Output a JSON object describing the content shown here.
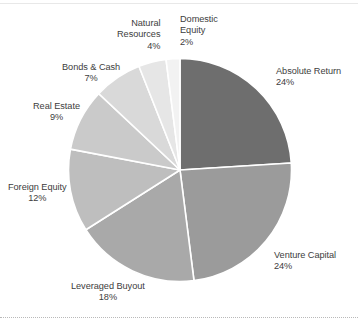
{
  "chart_data": {
    "type": "pie",
    "title": "",
    "subtitle": "",
    "xlabel": "",
    "ylabel": "",
    "legend_position": "callout-labels",
    "grid": false,
    "start_angle_deg": 0,
    "direction": "clockwise",
    "unit": "%",
    "categories": [
      "Absolute Return",
      "Venture Capital",
      "Leveraged Buyout",
      "Foreign Equity",
      "Real Estate",
      "Bonds & Cash",
      "Natural Resources",
      "Domestic Equity"
    ],
    "values": [
      24,
      24,
      18,
      12,
      9,
      7,
      4,
      2
    ],
    "slices": [
      {
        "label": "Absolute Return",
        "value": 24,
        "value_text": "24%",
        "color": "#6e6e6e"
      },
      {
        "label": "Venture Capital",
        "value": 24,
        "value_text": "24%",
        "color": "#9b9b9b"
      },
      {
        "label": "Leveraged Buyout",
        "value": 18,
        "value_text": "18%",
        "color": "#a9a9a9"
      },
      {
        "label": "Foreign Equity",
        "value": 12,
        "value_text": "12%",
        "color": "#bebebe"
      },
      {
        "label": "Real Estate",
        "value": 9,
        "value_text": "9%",
        "color": "#cacaca"
      },
      {
        "label": "Bonds & Cash",
        "value": 7,
        "value_text": "7%",
        "color": "#d9d9d9"
      },
      {
        "label": "Natural Resources",
        "value": 4,
        "value_text": "4%",
        "color": "#e6e6e6"
      },
      {
        "label": "Domestic Equity",
        "value": 2,
        "value_text": "2%",
        "color": "#f2f2f2"
      }
    ]
  },
  "labels": {
    "absolute_return": {
      "name": "Absolute Return",
      "pct": "24%"
    },
    "venture_capital": {
      "name": "Venture Capital",
      "pct": "24%"
    },
    "leveraged_buyout": {
      "name": "Leveraged Buyout",
      "pct": "18%"
    },
    "foreign_equity": {
      "name": "Foreign Equity",
      "pct": "12%"
    },
    "real_estate": {
      "name": "Real Estate",
      "pct": "9%"
    },
    "bonds_cash": {
      "name": "Bonds & Cash",
      "pct": "7%"
    },
    "natural_resources": {
      "name_line1": "Natural",
      "name_line2": "Resources",
      "pct": "4%"
    },
    "domestic_equity": {
      "name_line1": "Domestic",
      "name_line2": "Equity",
      "pct": "2%"
    }
  },
  "colors": {
    "background": "#ffffff",
    "text": "#3d3d3d",
    "slice_border": "#ffffff",
    "rule": "#e8e8e8",
    "dotted_rule": "#b9b9b9"
  }
}
